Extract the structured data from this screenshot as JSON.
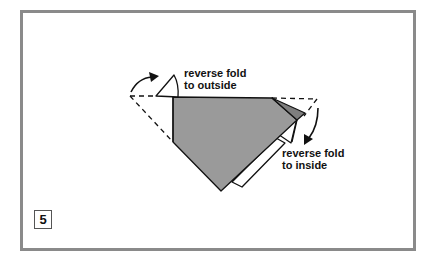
{
  "diagram": {
    "step_number": "5",
    "labels": [
      {
        "line1": "reverse fold",
        "line2": "to outside"
      },
      {
        "line1": "reverse fold",
        "line2": "to inside"
      }
    ],
    "colors": {
      "frame": "#8a8a8a",
      "paper_gray": "#9a9a9a",
      "paper_dark": "#7e7e7e",
      "paper_white": "#ffffff",
      "line": "#111111"
    }
  }
}
